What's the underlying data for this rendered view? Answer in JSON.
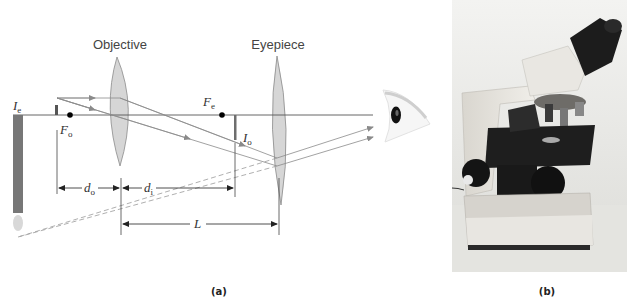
{
  "figure": {
    "panel_a": {
      "label": "(a)",
      "lenses": {
        "objective": {
          "label": "Objective"
        },
        "eyepiece": {
          "label": "Eyepiece"
        }
      },
      "focal_points": {
        "objective": {
          "symbol": "F",
          "subscript": "o"
        },
        "eyepiece": {
          "symbol": "F",
          "subscript": "e"
        }
      },
      "images": {
        "intermediate": {
          "symbol": "I",
          "subscript": "o"
        },
        "final": {
          "symbol": "I",
          "subscript": "e"
        }
      },
      "dimensions": {
        "object_distance": {
          "symbol": "d",
          "subscript": "o"
        },
        "image_distance": {
          "symbol": "d",
          "subscript": "i"
        },
        "lens_separation": {
          "symbol": "L"
        }
      }
    },
    "panel_b": {
      "label": "(b)",
      "subject": "compound-light-microscope-photo"
    },
    "colors": {
      "axis_line": "#555555",
      "ray_line": "#8a8a8a",
      "lens_fill": "#d6d6d6",
      "lens_stroke": "#8a8a8a",
      "image_bar": "#6e6e6e",
      "focal_dot": "#000000",
      "photo_bg": "#e8e8e4"
    }
  }
}
